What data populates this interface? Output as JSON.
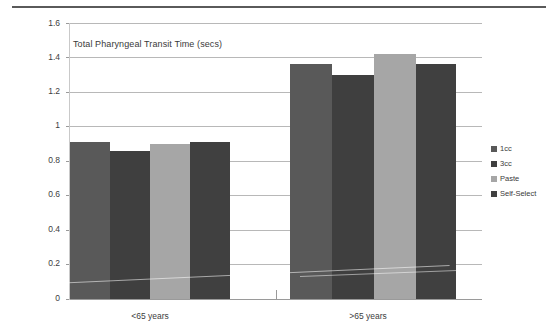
{
  "chart_data": {
    "type": "bar",
    "title": "Total Pharyngeal Transit Time (secs)",
    "xlabel": "",
    "ylabel": "",
    "ylim": [
      0,
      1.6
    ],
    "ytick_step": 0.2,
    "yticks": [
      "0",
      "0.2",
      "0.4",
      "0.6",
      "0.8",
      "1",
      "1.2",
      "1.4",
      "1.6"
    ],
    "grid": true,
    "legend_position": "right",
    "categories": [
      "<65 years",
      ">65 years"
    ],
    "series": [
      {
        "name": "1cc",
        "color": "#595959",
        "values": [
          0.91,
          1.36
        ]
      },
      {
        "name": "3cc",
        "color": "#3f3f3f",
        "values": [
          0.86,
          1.3
        ]
      },
      {
        "name": "Paste",
        "color": "#a6a6a6",
        "values": [
          0.9,
          1.42
        ]
      },
      {
        "name": "Self-Select",
        "color": "#404040",
        "values": [
          0.91,
          1.36
        ]
      }
    ]
  },
  "legend": {
    "items": [
      {
        "label": "1cc"
      },
      {
        "label": "3cc"
      },
      {
        "label": "Paste"
      },
      {
        "label": "Self-Select"
      }
    ]
  },
  "axis": {
    "y_labels": [
      "1.6",
      "1.4",
      "1.2",
      "1",
      "0.8",
      "0.6",
      "0.4",
      "0.2",
      "0"
    ],
    "x_labels": [
      "<65 years",
      ">65 years"
    ]
  }
}
